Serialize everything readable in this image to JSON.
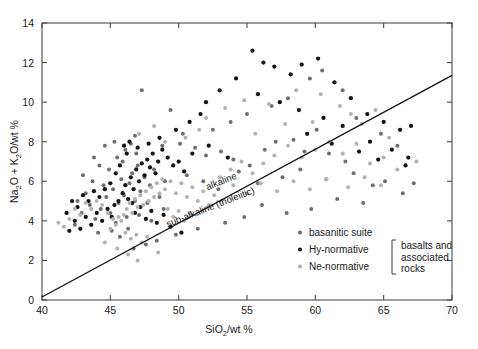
{
  "figure": {
    "background_color": "#ffffff",
    "frame_color": "#4a4a4a"
  },
  "chart_data": {
    "type": "scatter",
    "title": "",
    "xlabel": "SiO2/wt %",
    "xlabel_parts": {
      "pre": "SiO",
      "sub": "2",
      "post": "/wt %"
    },
    "ylabel": "Na2O + K2O/wt %",
    "ylabel_parts": {
      "a": "Na",
      "a_sub": "2",
      "b": "O + K",
      "b_sub": "2",
      "c": "O/wt %"
    },
    "xlim": [
      40,
      70
    ],
    "ylim": [
      0,
      14
    ],
    "xticks": [
      40,
      45,
      50,
      55,
      60,
      65,
      70
    ],
    "yticks": [
      0,
      2,
      4,
      6,
      8,
      10,
      12,
      14
    ],
    "grid": false,
    "legend_position": "bottom-right",
    "annotations": [
      {
        "name": "alkaline-label",
        "text": "alkaline",
        "x": 53.2,
        "y": 5.85,
        "rotation": -21.5
      },
      {
        "name": "subalkaline-label",
        "text": "sub-alkaline (tholeiitic)",
        "x": 52.4,
        "y": 4.55,
        "rotation": -21.5
      }
    ],
    "divider": {
      "name": "alkaline-subalkaline-divider",
      "x1": 40.0,
      "y1": 0.15,
      "x2": 70.0,
      "y2": 11.35
    },
    "series": [
      {
        "name": "basanitic suite",
        "marker_color": "#6e6e6e",
        "marker_size": 3.2,
        "points": [
          [
            43.9,
            4.1
          ],
          [
            44.3,
            4.6
          ],
          [
            44.7,
            5.2
          ],
          [
            45.0,
            4.4
          ],
          [
            45.2,
            5.6
          ],
          [
            45.4,
            3.9
          ],
          [
            45.6,
            4.9
          ],
          [
            45.8,
            6.1
          ],
          [
            46.0,
            5.3
          ],
          [
            46.2,
            4.2
          ],
          [
            46.4,
            5.9
          ],
          [
            46.6,
            6.4
          ],
          [
            46.8,
            5.0
          ],
          [
            47.0,
            6.8
          ],
          [
            47.2,
            5.5
          ],
          [
            44.1,
            3.4
          ],
          [
            44.5,
            5.8
          ],
          [
            45.9,
            7.0
          ],
          [
            46.1,
            7.6
          ],
          [
            46.5,
            7.9
          ],
          [
            43.5,
            4.8
          ],
          [
            43.2,
            5.4
          ],
          [
            44.9,
            6.6
          ],
          [
            45.5,
            7.2
          ],
          [
            46.9,
            7.4
          ],
          [
            47.5,
            6.2
          ],
          [
            47.9,
            5.8
          ],
          [
            48.2,
            6.6
          ],
          [
            48.6,
            5.2
          ],
          [
            49.0,
            6.0
          ],
          [
            42.9,
            4.4
          ],
          [
            43.7,
            6.0
          ],
          [
            44.2,
            6.8
          ],
          [
            45.1,
            3.5
          ],
          [
            45.7,
            3.2
          ],
          [
            46.3,
            3.6
          ],
          [
            47.1,
            4.3
          ],
          [
            47.7,
            4.9
          ],
          [
            48.0,
            4.0
          ],
          [
            48.9,
            4.6
          ],
          [
            47.3,
            10.6
          ],
          [
            49.4,
            9.6
          ],
          [
            50.1,
            7.9
          ],
          [
            51.2,
            7.7
          ],
          [
            52.0,
            7.3
          ],
          [
            53.1,
            7.5
          ],
          [
            54.0,
            7.1
          ],
          [
            55.2,
            6.8
          ],
          [
            56.3,
            7.6
          ],
          [
            57.1,
            8.0
          ],
          [
            58.4,
            8.1
          ],
          [
            59.2,
            7.5
          ],
          [
            60.1,
            8.6
          ],
          [
            61.0,
            7.4
          ],
          [
            62.2,
            7.0
          ],
          [
            50.6,
            6.3
          ],
          [
            51.8,
            6.0
          ],
          [
            52.9,
            5.6
          ],
          [
            54.4,
            6.5
          ],
          [
            55.8,
            5.9
          ],
          [
            57.6,
            6.2
          ],
          [
            58.9,
            6.6
          ],
          [
            60.8,
            6.1
          ],
          [
            62.8,
            6.4
          ],
          [
            64.2,
            5.8
          ],
          [
            65.1,
            6.0
          ],
          [
            66.4,
            5.4
          ],
          [
            67.2,
            5.9
          ],
          [
            63.5,
            4.9
          ],
          [
            61.6,
            5.1
          ],
          [
            59.7,
            4.6
          ],
          [
            57.9,
            4.4
          ],
          [
            56.1,
            4.8
          ],
          [
            54.8,
            4.2
          ],
          [
            53.4,
            3.9
          ],
          [
            51.4,
            3.6
          ],
          [
            49.8,
            3.3
          ],
          [
            48.4,
            3.0
          ],
          [
            47.6,
            2.8
          ],
          [
            46.7,
            2.6
          ],
          [
            42.6,
            5.0
          ],
          [
            42.4,
            3.8
          ],
          [
            43.0,
            6.3
          ],
          [
            43.8,
            7.2
          ],
          [
            44.6,
            7.8
          ],
          [
            45.3,
            8.0
          ],
          [
            46.8,
            8.3
          ],
          [
            48.8,
            7.8
          ],
          [
            50.3,
            8.4
          ],
          [
            52.5,
            8.6
          ],
          [
            53.8,
            9.0
          ],
          [
            55.0,
            9.4
          ],
          [
            56.8,
            9.8
          ],
          [
            58.0,
            10.2
          ],
          [
            59.6,
            11.2
          ],
          [
            60.5,
            11.6
          ],
          [
            62.0,
            10.6
          ],
          [
            63.0,
            9.2
          ],
          [
            64.8,
            8.4
          ],
          [
            66.0,
            7.8
          ]
        ]
      },
      {
        "name": "Hy-normative",
        "marker_color": "#141414",
        "marker_size": 3.4,
        "points": [
          [
            45.6,
            5.0
          ],
          [
            45.9,
            5.4
          ],
          [
            46.1,
            5.8
          ],
          [
            46.3,
            5.1
          ],
          [
            46.5,
            6.2
          ],
          [
            46.7,
            5.6
          ],
          [
            46.9,
            6.6
          ],
          [
            47.1,
            6.0
          ],
          [
            47.3,
            6.9
          ],
          [
            47.5,
            6.3
          ],
          [
            47.7,
            7.1
          ],
          [
            47.9,
            6.7
          ],
          [
            48.1,
            7.4
          ],
          [
            48.3,
            6.4
          ],
          [
            48.5,
            7.0
          ],
          [
            44.8,
            4.6
          ],
          [
            45.1,
            4.2
          ],
          [
            45.3,
            4.8
          ],
          [
            44.4,
            4.0
          ],
          [
            44.0,
            4.4
          ],
          [
            43.6,
            3.8
          ],
          [
            43.2,
            4.2
          ],
          [
            42.8,
            3.6
          ],
          [
            42.4,
            4.0
          ],
          [
            42.0,
            3.5
          ],
          [
            46.0,
            7.8
          ],
          [
            46.4,
            8.0
          ],
          [
            46.2,
            7.4
          ],
          [
            47.0,
            7.7
          ],
          [
            47.8,
            7.9
          ],
          [
            48.8,
            7.6
          ],
          [
            49.2,
            7.2
          ],
          [
            49.6,
            6.8
          ],
          [
            50.0,
            7.0
          ],
          [
            50.4,
            6.5
          ],
          [
            45.0,
            5.9
          ],
          [
            45.4,
            6.4
          ],
          [
            45.7,
            6.8
          ],
          [
            46.6,
            4.9
          ],
          [
            46.8,
            4.4
          ],
          [
            47.2,
            4.7
          ],
          [
            47.6,
            4.1
          ],
          [
            48.0,
            4.5
          ],
          [
            48.4,
            3.9
          ],
          [
            48.9,
            4.3
          ],
          [
            49.4,
            3.7
          ],
          [
            50.2,
            3.4
          ],
          [
            44.6,
            5.6
          ],
          [
            44.2,
            5.2
          ],
          [
            43.8,
            5.5
          ],
          [
            43.4,
            5.0
          ],
          [
            43.0,
            5.3
          ],
          [
            42.6,
            4.7
          ],
          [
            42.2,
            5.0
          ],
          [
            41.8,
            4.4
          ],
          [
            51.0,
            7.4
          ],
          [
            52.2,
            7.8
          ],
          [
            53.6,
            7.2
          ],
          [
            55.4,
            12.6
          ],
          [
            56.2,
            12.0
          ],
          [
            57.0,
            11.8
          ],
          [
            58.2,
            11.4
          ],
          [
            59.0,
            11.9
          ],
          [
            60.2,
            12.2
          ],
          [
            61.4,
            11.0
          ],
          [
            62.6,
            10.2
          ],
          [
            63.8,
            9.4
          ],
          [
            65.0,
            9.0
          ],
          [
            66.2,
            8.6
          ],
          [
            67.0,
            8.8
          ],
          [
            54.2,
            11.2
          ],
          [
            53.0,
            10.6
          ],
          [
            52.0,
            10.0
          ],
          [
            51.6,
            9.4
          ],
          [
            50.8,
            9.0
          ],
          [
            49.8,
            8.6
          ],
          [
            48.6,
            8.2
          ],
          [
            55.8,
            10.4
          ],
          [
            57.4,
            10.0
          ],
          [
            58.8,
            9.6
          ],
          [
            60.6,
            9.2
          ],
          [
            62.0,
            8.8
          ],
          [
            64.0,
            8.0
          ],
          [
            65.6,
            7.6
          ],
          [
            66.8,
            7.2
          ],
          [
            59.4,
            8.4
          ],
          [
            61.2,
            7.9
          ],
          [
            63.2,
            7.5
          ],
          [
            64.6,
            7.1
          ],
          [
            66.6,
            6.8
          ]
        ]
      },
      {
        "name": "Ne-normative",
        "marker_color": "#b2b2b2",
        "marker_size": 3.2,
        "points": [
          [
            46.0,
            4.3
          ],
          [
            46.2,
            4.6
          ],
          [
            46.4,
            4.9
          ],
          [
            46.6,
            4.4
          ],
          [
            46.8,
            5.1
          ],
          [
            47.0,
            4.7
          ],
          [
            47.2,
            5.3
          ],
          [
            47.4,
            4.8
          ],
          [
            47.6,
            5.5
          ],
          [
            47.8,
            5.0
          ],
          [
            48.0,
            5.7
          ],
          [
            48.2,
            5.2
          ],
          [
            48.4,
            5.9
          ],
          [
            48.6,
            5.4
          ],
          [
            48.8,
            6.1
          ],
          [
            45.8,
            4.0
          ],
          [
            45.6,
            4.2
          ],
          [
            45.4,
            3.8
          ],
          [
            45.2,
            4.1
          ],
          [
            45.0,
            3.6
          ],
          [
            46.1,
            3.4
          ],
          [
            46.5,
            3.1
          ],
          [
            46.9,
            3.3
          ],
          [
            47.3,
            2.9
          ],
          [
            47.7,
            3.2
          ],
          [
            49.0,
            5.6
          ],
          [
            49.4,
            6.0
          ],
          [
            49.8,
            5.4
          ],
          [
            50.2,
            5.9
          ],
          [
            50.6,
            5.2
          ],
          [
            51.0,
            5.7
          ],
          [
            51.4,
            5.0
          ],
          [
            51.8,
            5.5
          ],
          [
            52.2,
            4.8
          ],
          [
            52.6,
            5.3
          ],
          [
            49.2,
            4.6
          ],
          [
            49.6,
            4.2
          ],
          [
            50.0,
            4.5
          ],
          [
            50.4,
            4.0
          ],
          [
            50.8,
            4.4
          ],
          [
            44.8,
            4.4
          ],
          [
            44.4,
            4.8
          ],
          [
            44.0,
            5.0
          ],
          [
            43.6,
            4.6
          ],
          [
            43.2,
            4.9
          ],
          [
            42.8,
            4.3
          ],
          [
            42.4,
            4.6
          ],
          [
            42.0,
            4.1
          ],
          [
            41.6,
            3.7
          ],
          [
            41.2,
            3.9
          ],
          [
            53.0,
            6.2
          ],
          [
            53.8,
            6.6
          ],
          [
            54.6,
            7.0
          ],
          [
            55.4,
            6.4
          ],
          [
            56.2,
            6.9
          ],
          [
            57.0,
            7.3
          ],
          [
            58.0,
            7.8
          ],
          [
            59.0,
            7.2
          ],
          [
            60.0,
            7.6
          ],
          [
            61.0,
            8.0
          ],
          [
            62.0,
            7.4
          ],
          [
            63.0,
            7.9
          ],
          [
            64.0,
            6.9
          ],
          [
            65.0,
            7.2
          ],
          [
            66.0,
            6.6
          ],
          [
            54.0,
            5.8
          ],
          [
            55.0,
            5.4
          ],
          [
            56.0,
            5.9
          ],
          [
            57.2,
            5.5
          ],
          [
            58.4,
            6.0
          ],
          [
            59.6,
            5.6
          ],
          [
            60.8,
            6.1
          ],
          [
            62.4,
            5.7
          ],
          [
            63.6,
            6.2
          ],
          [
            64.8,
            5.8
          ],
          [
            52.0,
            9.2
          ],
          [
            53.4,
            9.7
          ],
          [
            54.8,
            10.1
          ],
          [
            56.6,
            9.9
          ],
          [
            58.6,
            10.6
          ],
          [
            60.4,
            10.4
          ],
          [
            61.8,
            9.8
          ],
          [
            63.4,
            8.9
          ],
          [
            65.4,
            8.2
          ],
          [
            67.4,
            7.0
          ],
          [
            47.1,
            8.4
          ],
          [
            48.2,
            8.8
          ],
          [
            49.0,
            8.0
          ],
          [
            50.5,
            8.2
          ],
          [
            51.5,
            8.6
          ],
          [
            45.5,
            2.6
          ],
          [
            46.3,
            2.3
          ],
          [
            47.0,
            2.0
          ],
          [
            48.5,
            2.4
          ],
          [
            44.6,
            2.9
          ],
          [
            55.6,
            8.4
          ],
          [
            57.8,
            8.9
          ],
          [
            59.8,
            9.0
          ],
          [
            62.6,
            9.4
          ],
          [
            64.4,
            9.6
          ]
        ]
      }
    ]
  },
  "legend": {
    "items": [
      {
        "label": "basanitic suite",
        "color": "#6e6e6e"
      },
      {
        "label": "Hy-normative",
        "color": "#141414"
      },
      {
        "label": "Ne-normative",
        "color": "#b2b2b2"
      }
    ],
    "group_label_lines": [
      "basalts and",
      "associated",
      "rocks"
    ]
  }
}
